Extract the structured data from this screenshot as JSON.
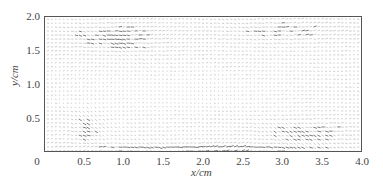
{
  "chart_data": {
    "type": "quiver",
    "title": "",
    "xlabel": "x/cm",
    "ylabel": "y/cm",
    "xlim": [
      0,
      4.0
    ],
    "ylim": [
      0,
      2.0
    ],
    "x_ticks": [
      0,
      0.5,
      1.0,
      1.5,
      2.0,
      2.5,
      3.0,
      3.5,
      4.0
    ],
    "x_tick_labels": [
      "0",
      "0.5",
      "1.0",
      "1.5",
      "2.0",
      "2.5",
      "3.0",
      "3.5",
      "4.0"
    ],
    "y_ticks": [
      0.5,
      1.0,
      1.5,
      2.0
    ],
    "y_tick_labels": [
      "0.5",
      "1.0",
      "1.5",
      "2.0"
    ],
    "grid": false,
    "legend": null,
    "field": {
      "nx": 80,
      "ny": 34,
      "dominant_direction": "positive x",
      "regions": [
        {
          "name": "near-wall dark streak",
          "x": [
            0.0,
            4.0
          ],
          "y": [
            0.0,
            0.15
          ],
          "relative_magnitude": 1.0
        },
        {
          "name": "upper-left dark patch",
          "x": [
            0.2,
            1.6
          ],
          "y": [
            1.45,
            1.95
          ],
          "relative_magnitude": 0.8
        },
        {
          "name": "upper-right moderate",
          "x": [
            2.0,
            4.0
          ],
          "y": [
            1.6,
            2.0
          ],
          "relative_magnitude": 0.6
        },
        {
          "name": "lower-left inclined structure",
          "x": [
            0.3,
            0.7
          ],
          "y": [
            0.1,
            0.65
          ],
          "relative_magnitude": 0.75
        },
        {
          "name": "central light region",
          "x": [
            0.0,
            3.0
          ],
          "y": [
            0.6,
            1.2
          ],
          "relative_magnitude": 0.3
        },
        {
          "name": "lower-right rising band",
          "x": [
            2.6,
            4.0
          ],
          "y": [
            0.1,
            0.5
          ],
          "relative_magnitude": 0.7
        }
      ]
    }
  },
  "colors": {
    "axis": "#555555",
    "text": "#444444",
    "vector": "#222222",
    "background": "#ffffff"
  }
}
